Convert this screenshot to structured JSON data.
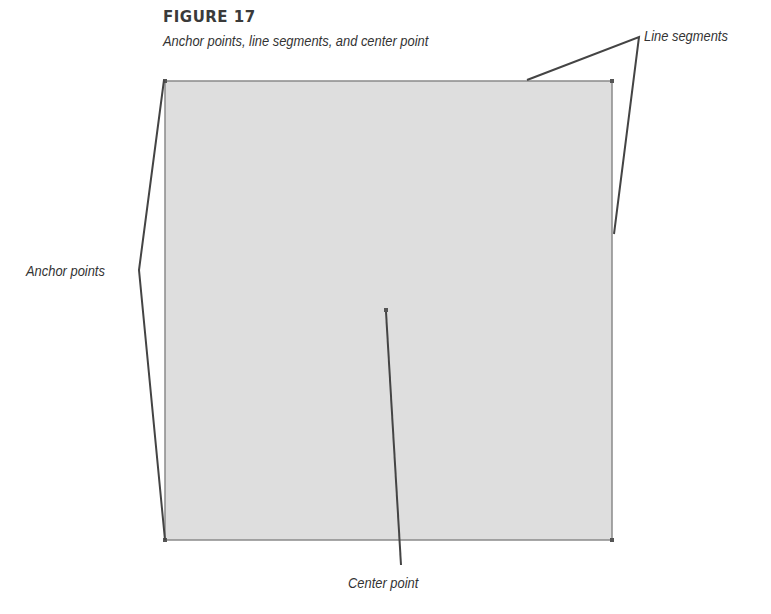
{
  "figure": {
    "title": "FIGURE 17",
    "caption": "Anchor points, line segments, and center point"
  },
  "labels": {
    "line_segments": "Line segments",
    "anchor_points": "Anchor points",
    "center_point": "Center point"
  },
  "shape": {
    "type": "rectangle",
    "fill": "#dedede",
    "stroke": "#888888",
    "corners": [
      [
        165,
        81
      ],
      [
        612,
        81
      ],
      [
        612,
        540
      ],
      [
        165,
        540
      ]
    ],
    "center": [
      386,
      310
    ]
  },
  "colors": {
    "callout_line": "#444444",
    "text": "#333333",
    "anchor": "#555555"
  }
}
